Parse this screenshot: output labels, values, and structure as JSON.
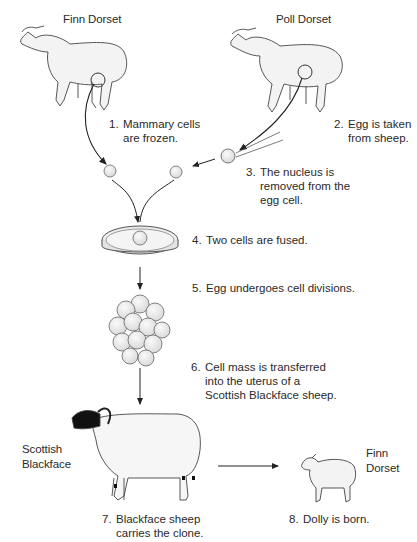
{
  "title_labels": {
    "donor_left": "Finn Dorset",
    "donor_right": "Poll Dorset",
    "surrogate": [
      "Scottish",
      "Blackface"
    ],
    "offspring": [
      "Finn",
      "Dorset"
    ]
  },
  "steps": [
    {
      "num": "1.",
      "lines": [
        "Mammary cells",
        "are frozen."
      ]
    },
    {
      "num": "2.",
      "lines": [
        "Egg is taken",
        "from sheep."
      ]
    },
    {
      "num": "3.",
      "lines": [
        "The nucleus is",
        "removed from the",
        "egg cell."
      ]
    },
    {
      "num": "4.",
      "lines": [
        "Two cells are fused."
      ]
    },
    {
      "num": "5.",
      "lines": [
        "Egg undergoes cell divisions."
      ]
    },
    {
      "num": "6.",
      "lines": [
        "Cell mass is transferred",
        "into the uterus of a",
        "Scottish Blackface sheep."
      ]
    },
    {
      "num": "7.",
      "lines": [
        "Blackface sheep",
        "carries the clone."
      ]
    },
    {
      "num": "8.",
      "lines": [
        "Dolly is born."
      ]
    }
  ],
  "colors": {
    "line": "#333333",
    "sheep_fill": "#f2f2f2",
    "blackface": "#111111",
    "cell_fill": "#e6e6e6"
  }
}
